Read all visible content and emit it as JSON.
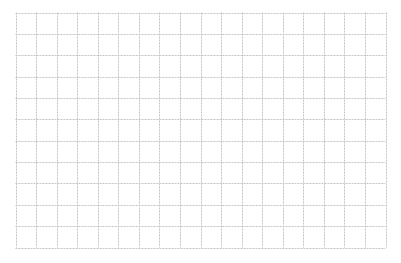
{
  "grid": {
    "x0": 15.5,
    "y0": 12.5,
    "x1": 385.5,
    "y1": 247.5,
    "columns": 18,
    "rows": 11,
    "line_color": "#c4c4c4",
    "background": "#ffffff"
  }
}
